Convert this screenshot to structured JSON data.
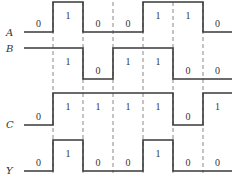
{
  "diagram": {
    "title": "",
    "x_start": 24,
    "x_end": 232,
    "boundaries": [
      53,
      83,
      113,
      143,
      173,
      203
    ],
    "colors": {
      "wave": "#3a3a3a",
      "dash": "#888888",
      "text": "#333333"
    },
    "signals": [
      {
        "name": "A",
        "label_y": 36,
        "high_y": 2,
        "low_y": 32,
        "segments": [
          {
            "from": 24,
            "to": 53,
            "level": 0,
            "label": "0"
          },
          {
            "from": 53,
            "to": 83,
            "level": 1,
            "label": "1"
          },
          {
            "from": 83,
            "to": 113,
            "level": 0,
            "label": "0"
          },
          {
            "from": 113,
            "to": 143,
            "level": 0,
            "label": "0"
          },
          {
            "from": 143,
            "to": 173,
            "level": 1,
            "label": "1"
          },
          {
            "from": 173,
            "to": 203,
            "level": 1,
            "label": "1"
          },
          {
            "from": 203,
            "to": 232,
            "level": 0,
            "label": "0"
          }
        ]
      },
      {
        "name": "B",
        "label_y": 52,
        "high_y": 48,
        "low_y": 79,
        "segments": [
          {
            "from": 24,
            "to": 53,
            "level": 1,
            "label": ""
          },
          {
            "from": 53,
            "to": 83,
            "level": 1,
            "label": "1"
          },
          {
            "from": 83,
            "to": 113,
            "level": 0,
            "label": "0"
          },
          {
            "from": 113,
            "to": 143,
            "level": 1,
            "label": "1"
          },
          {
            "from": 143,
            "to": 173,
            "level": 1,
            "label": "1"
          },
          {
            "from": 173,
            "to": 203,
            "level": 0,
            "label": "0"
          },
          {
            "from": 203,
            "to": 232,
            "level": 0,
            "label": "0"
          }
        ]
      },
      {
        "name": "C",
        "label_y": 128,
        "high_y": 93,
        "low_y": 125,
        "segments": [
          {
            "from": 24,
            "to": 53,
            "level": 0,
            "label": "0"
          },
          {
            "from": 53,
            "to": 83,
            "level": 1,
            "label": "1"
          },
          {
            "from": 83,
            "to": 113,
            "level": 1,
            "label": "1"
          },
          {
            "from": 113,
            "to": 143,
            "level": 1,
            "label": "1"
          },
          {
            "from": 143,
            "to": 173,
            "level": 1,
            "label": "1"
          },
          {
            "from": 173,
            "to": 203,
            "level": 0,
            "label": "0"
          },
          {
            "from": 203,
            "to": 232,
            "level": 1,
            "label": "1"
          }
        ]
      },
      {
        "name": "Y",
        "label_y": 174,
        "high_y": 140,
        "low_y": 171,
        "segments": [
          {
            "from": 24,
            "to": 53,
            "level": 0,
            "label": "0"
          },
          {
            "from": 53,
            "to": 83,
            "level": 1,
            "label": "1"
          },
          {
            "from": 83,
            "to": 113,
            "level": 0,
            "label": "0"
          },
          {
            "from": 113,
            "to": 143,
            "level": 0,
            "label": "0"
          },
          {
            "from": 143,
            "to": 173,
            "level": 1,
            "label": "1"
          },
          {
            "from": 173,
            "to": 203,
            "level": 0,
            "label": "0"
          },
          {
            "from": 203,
            "to": 232,
            "level": 0,
            "label": "0"
          }
        ]
      }
    ]
  }
}
